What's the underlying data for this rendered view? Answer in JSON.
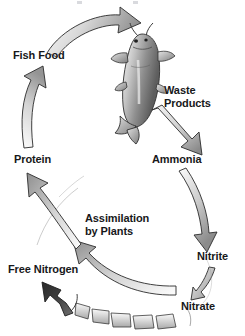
{
  "diagram": {
    "background_color": "#ffffff",
    "text_color": "#17181a",
    "arrow_fill_light": "#f2f2f2",
    "arrow_fill_mid": "#9a9a9a",
    "arrow_fill_dark": "#4a4a4a",
    "arrow_outline": "#2b2b2b",
    "labels": {
      "fish_food": "Fish Food",
      "waste_products": "Waste\nProducts",
      "protein": "Protein",
      "ammonia": "Ammonia",
      "assimilation": "Assimilation\nby Plants",
      "free_nitrogen": "Free Nitrogen",
      "nitrite": "Nitrite",
      "nitrate": "Nitrate"
    },
    "nodes": [
      "Fish Food",
      "Waste Products",
      "Ammonia",
      "Nitrite",
      "Nitrate",
      "Free Nitrogen",
      "Protein"
    ],
    "arrows": [
      {
        "name": "fish-food-to-fish",
        "from": "Fish Food",
        "to": "Fish"
      },
      {
        "name": "protein-to-fish-food",
        "from": "Protein",
        "to": "Fish Food"
      },
      {
        "name": "waste-to-ammonia",
        "from": "Waste Products",
        "to": "Ammonia"
      },
      {
        "name": "ammonia-to-nitrite",
        "from": "Ammonia",
        "to": "Nitrite"
      },
      {
        "name": "nitrite-to-nitrate",
        "from": "Nitrite",
        "to": "Nitrate"
      },
      {
        "name": "nitrate-to-protein",
        "from": "Nitrate",
        "to": "Protein"
      },
      {
        "name": "nitrate-to-free-nitrogen",
        "from": "Nitrate",
        "to": "Free Nitrogen"
      }
    ],
    "illustration": "catfish"
  }
}
